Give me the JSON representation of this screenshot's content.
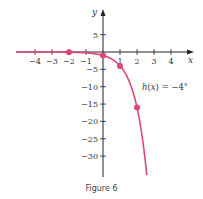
{
  "chart_data": {
    "type": "line",
    "title": "",
    "caption": "Figure 6",
    "xlabel": "x",
    "ylabel": "y",
    "function_label": "h(x) = −4",
    "function_exponent": "x",
    "xlim": [
      -5,
      5
    ],
    "ylim": [
      -35,
      8
    ],
    "x_ticks": [
      -4,
      -3,
      -2,
      -1,
      1,
      2,
      3,
      4
    ],
    "x_tick_labels": [
      "−4",
      "−3",
      "−2",
      "−1",
      "1",
      "2",
      "3",
      "4"
    ],
    "y_ticks": [
      5,
      -5,
      -10,
      -15,
      -20,
      -25,
      -30
    ],
    "y_tick_labels": [
      "5",
      "−5",
      "−10",
      "−15",
      "−20",
      "−25",
      "−30"
    ],
    "grid": false,
    "series": [
      {
        "name": "h(x) = -4^x",
        "color": "#e0457a",
        "highlighted_points": [
          {
            "x": -2,
            "y": -0.0625
          },
          {
            "x": 0,
            "y": -1
          },
          {
            "x": 1,
            "y": -4
          },
          {
            "x": 2,
            "y": -16
          }
        ]
      }
    ]
  },
  "caption": "Figure 6"
}
